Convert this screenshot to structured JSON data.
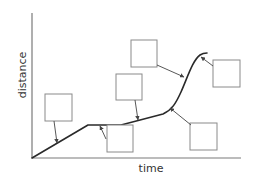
{
  "diagram": {
    "type": "distance-time graph with blank labelling boxes",
    "axes": {
      "x_label": "time",
      "y_label": "distance"
    },
    "colors": {
      "axis": "#7a7a7a",
      "curve": "#2a2a2a",
      "box_border": "#8a8a8a",
      "arrow": "#444444"
    },
    "boxes": [
      {
        "id": "box-1",
        "label": "",
        "x": 45,
        "y": 94,
        "w": 27,
        "h": 27
      },
      {
        "id": "box-2",
        "label": "",
        "x": 107,
        "y": 125,
        "w": 26,
        "h": 27
      },
      {
        "id": "box-3",
        "label": "",
        "x": 116,
        "y": 74,
        "w": 26,
        "h": 26
      },
      {
        "id": "box-4",
        "label": "",
        "x": 131,
        "y": 40,
        "w": 26,
        "h": 27
      },
      {
        "id": "box-5",
        "label": "",
        "x": 213,
        "y": 60,
        "w": 27,
        "h": 27
      },
      {
        "id": "box-6",
        "label": "",
        "x": 190,
        "y": 123,
        "w": 27,
        "h": 27
      }
    ]
  }
}
